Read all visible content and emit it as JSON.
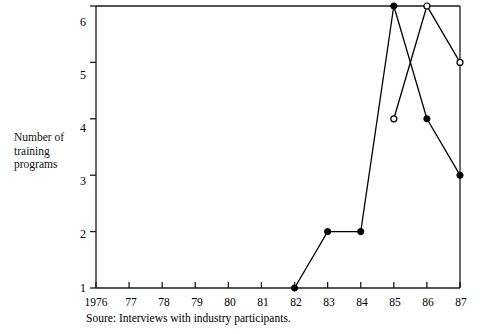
{
  "chart_data": {
    "type": "line",
    "title": "",
    "xlabel": "",
    "ylabel": "Number of training programs",
    "ylabel_lines": [
      "Number of",
      "training",
      "programs"
    ],
    "caption": "Soure: Interviews with industry participants.",
    "x": [
      1976,
      1977,
      1978,
      1979,
      1980,
      1981,
      1982,
      1983,
      1984,
      1985,
      1986,
      1987
    ],
    "xtick_labels": [
      "1976",
      "77",
      "78",
      "79",
      "80",
      "81",
      "82",
      "83",
      "84",
      "85",
      "86",
      "87"
    ],
    "ytick_labels": [
      "1",
      "2",
      "3",
      "4",
      "5",
      "6"
    ],
    "ytick_values": [
      1,
      2,
      3,
      4,
      5,
      6
    ],
    "ylim": [
      1,
      6
    ],
    "xlim": [
      1976,
      1987
    ],
    "grid": false,
    "legend": "none",
    "series": [
      {
        "name": "filled-circle-series",
        "marker": "filled-circle",
        "color": "#000000",
        "points": [
          {
            "x": 1982,
            "y": 1
          },
          {
            "x": 1983,
            "y": 2
          },
          {
            "x": 1984,
            "y": 2
          },
          {
            "x": 1985,
            "y": 6
          },
          {
            "x": 1986,
            "y": 4
          },
          {
            "x": 1987,
            "y": 3
          }
        ]
      },
      {
        "name": "open-circle-series",
        "marker": "open-circle",
        "color": "#000000",
        "points": [
          {
            "x": 1985,
            "y": 4
          },
          {
            "x": 1986,
            "y": 6
          },
          {
            "x": 1987,
            "y": 5
          }
        ]
      }
    ]
  },
  "axis": {
    "frame_color": "#1a1a1a"
  }
}
